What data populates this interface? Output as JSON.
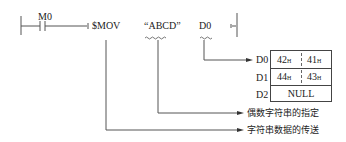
{
  "ladder": {
    "contact_label": "M0",
    "instruction": "$MOV",
    "source_operand": "“ABCD”",
    "dest_operand": "D0"
  },
  "registers": [
    {
      "name": "D0",
      "high": "42",
      "low": "41",
      "suffix": "H"
    },
    {
      "name": "D1",
      "high": "44",
      "low": "43",
      "suffix": "H"
    },
    {
      "name": "D2",
      "value": "NULL"
    }
  ],
  "annotations": {
    "source_note": "偶数字符串的指定",
    "instruction_note": "字符串数据的传送"
  },
  "colors": {
    "line": "#555555",
    "text": "#222222",
    "background": "#ffffff"
  }
}
